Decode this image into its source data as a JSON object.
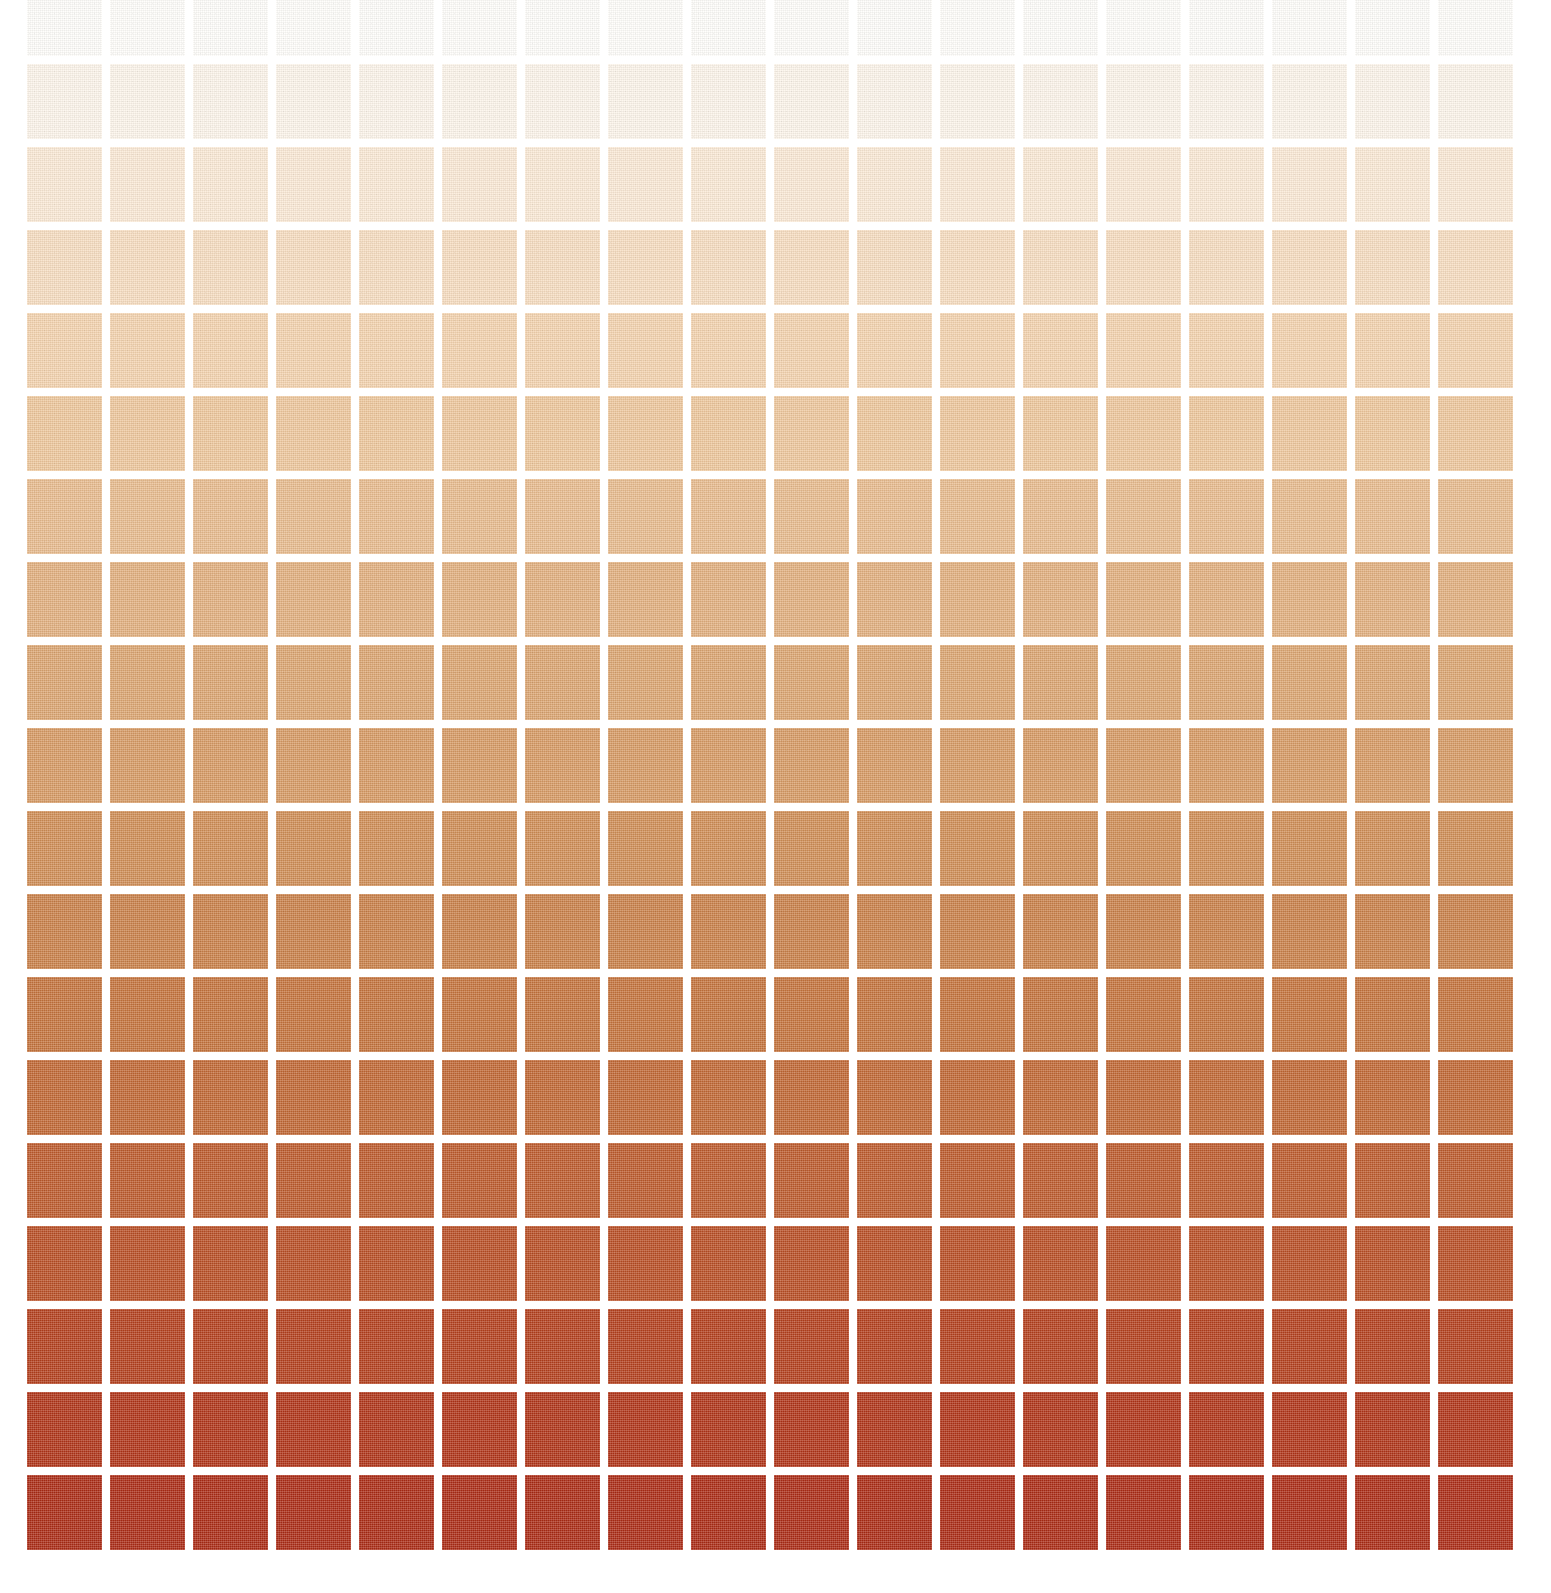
{
  "page": {
    "background_color": "#ffffff",
    "width": 1551,
    "height": 1593
  },
  "grid": {
    "columns": 18,
    "rows": 19,
    "cell_width": 75,
    "cell_height": 75,
    "gap": 8,
    "pitch": 83,
    "margin_left": 27,
    "margin_right": 29,
    "margin_bottom": 43,
    "top_row_clipped": true,
    "texture": "woven-canvas-fabric"
  },
  "chart_data": {
    "type": "heatmap",
    "title": "",
    "subtitle": "",
    "xlabel": "",
    "ylabel": "",
    "grid": true,
    "legend_position": "none",
    "orientation": "vertical-gradient",
    "columns": 18,
    "rows": 19,
    "row_index_labels": [
      1,
      2,
      3,
      4,
      5,
      6,
      7,
      8,
      9,
      10,
      11,
      12,
      13,
      14,
      15,
      16,
      17,
      18,
      19
    ],
    "column_index_labels": [
      1,
      2,
      3,
      4,
      5,
      6,
      7,
      8,
      9,
      10,
      11,
      12,
      13,
      14,
      15,
      16,
      17,
      18
    ],
    "row_colors": [
      "#fffefb",
      "#fdf5ea",
      "#fbe9d5",
      "#f7ddc0",
      "#f4d3ae",
      "#eec79c",
      "#e8bb8d",
      "#e2af7e",
      "#dca571",
      "#d79a63",
      "#d08d55",
      "#ca8048",
      "#c5733c",
      "#c16733",
      "#bd5a2b",
      "#b94d23",
      "#b43f1c",
      "#b03317",
      "#ab2a14"
    ],
    "row_values": [
      0.0,
      0.056,
      0.111,
      0.167,
      0.222,
      0.278,
      0.333,
      0.389,
      0.444,
      0.5,
      0.556,
      0.611,
      0.667,
      0.722,
      0.778,
      0.833,
      0.889,
      0.944,
      1.0
    ],
    "palette_name": "cream-to-brick-red sequential",
    "color_start": "#fffefb",
    "color_end": "#ab2a14",
    "zlim": [
      0,
      1
    ]
  }
}
